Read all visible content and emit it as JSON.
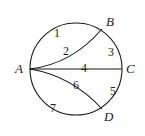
{
  "diagram": {
    "type": "circle-paths",
    "points": [
      {
        "name": "A",
        "x": 15,
        "y": 73
      },
      {
        "name": "B",
        "x": 106,
        "y": 26
      },
      {
        "name": "C",
        "x": 126,
        "y": 73
      },
      {
        "name": "D",
        "x": 107,
        "y": 120
      }
    ],
    "region_labels": [
      {
        "text": "1",
        "x": 54,
        "y": 38
      },
      {
        "text": "2",
        "x": 64,
        "y": 56
      },
      {
        "text": "3",
        "x": 109,
        "y": 55
      },
      {
        "text": "4",
        "x": 83,
        "y": 71
      },
      {
        "text": "5",
        "x": 111,
        "y": 96
      },
      {
        "text": "6",
        "x": 74,
        "y": 89
      },
      {
        "text": "7",
        "x": 50,
        "y": 112
      }
    ],
    "colors": {
      "line": "#1a1a1a",
      "background": "#ffffff"
    }
  }
}
